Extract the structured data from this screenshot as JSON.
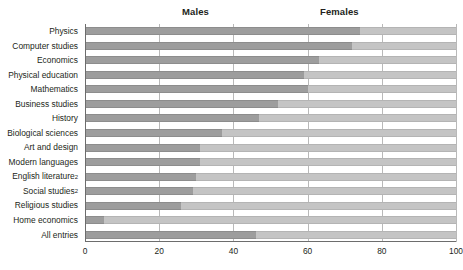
{
  "header": {
    "males_label": "Males",
    "females_label": "Females"
  },
  "axis": {
    "ticks": [
      0,
      20,
      40,
      60,
      80,
      100
    ],
    "min": 0,
    "max": 100
  },
  "colors": {
    "male_bar": "#9d9d9d",
    "female_bar": "#c4c4c4",
    "gridline": "#b9b9b9",
    "axis": "#6d6d6d",
    "text": "#231f20"
  },
  "chart_data": {
    "type": "bar",
    "orientation": "horizontal",
    "stacked": true,
    "percent": true,
    "title": "",
    "xlabel": "",
    "ylabel": "",
    "xlim": [
      0,
      100
    ],
    "grid": true,
    "legend_position": "top",
    "categories": [
      "Physics",
      "Computer studies",
      "Economics",
      "Physical education",
      "Mathematics",
      "Business studies",
      "History",
      "Biological sciences",
      "Art and design",
      "Modern languages",
      "English literature",
      "Social studies",
      "Religious studies",
      "Home economics",
      "All entries"
    ],
    "category_footnotes": {
      "English literature": "2",
      "Social studies": "2"
    },
    "series": [
      {
        "name": "Males",
        "values": [
          74,
          72,
          63,
          59,
          60,
          52,
          47,
          37,
          31,
          31,
          30,
          29,
          26,
          5,
          46
        ]
      },
      {
        "name": "Females",
        "values": [
          26,
          28,
          37,
          41,
          40,
          48,
          53,
          63,
          69,
          69,
          70,
          71,
          74,
          95,
          54
        ]
      }
    ]
  }
}
